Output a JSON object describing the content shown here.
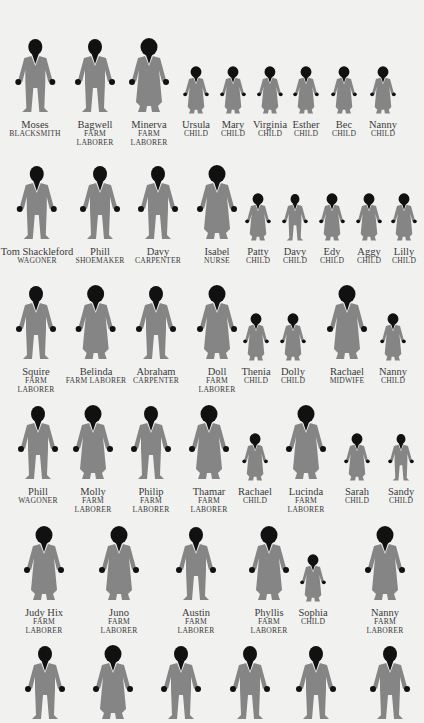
{
  "colors": {
    "background": "#f1f1f0",
    "body": "#858585",
    "head": "#111111",
    "text": "#3a3a3a"
  },
  "rows": [
    {
      "y": 36,
      "people": [
        {
          "name": "Moses",
          "occupation": "BLACKSMITH",
          "x": 35,
          "type": "man",
          "size": "adult"
        },
        {
          "name": "Bagwell",
          "occupation": "FARM LABORER",
          "x": 95,
          "type": "man",
          "size": "adult",
          "wrap": true
        },
        {
          "name": "Minerva",
          "occupation": "FARM LABORER",
          "x": 149,
          "type": "woman",
          "size": "adult",
          "wrap": true
        },
        {
          "name": "Ursula",
          "occupation": "CHILD",
          "x": 196,
          "type": "woman",
          "size": "child"
        },
        {
          "name": "Mary",
          "occupation": "CHILD",
          "x": 233,
          "type": "woman",
          "size": "child"
        },
        {
          "name": "Virginia",
          "occupation": "CHILD",
          "x": 270,
          "type": "woman",
          "size": "child"
        },
        {
          "name": "Esther",
          "occupation": "CHILD",
          "x": 306,
          "type": "woman",
          "size": "child"
        },
        {
          "name": "Bec",
          "occupation": "CHILD",
          "x": 344,
          "type": "woman",
          "size": "child"
        },
        {
          "name": "Nanny",
          "occupation": "CHILD",
          "x": 383,
          "type": "woman",
          "size": "child"
        }
      ]
    },
    {
      "y": 163,
      "people": [
        {
          "name": "Tom Shackleford",
          "occupation": "WAGONER",
          "x": 37,
          "type": "man",
          "size": "adult"
        },
        {
          "name": "Phill",
          "occupation": "SHOEMAKER",
          "x": 100,
          "type": "man",
          "size": "adult"
        },
        {
          "name": "Davy",
          "occupation": "CARPENTER",
          "x": 158,
          "type": "man",
          "size": "adult"
        },
        {
          "name": "Isabel",
          "occupation": "NURSE",
          "x": 217,
          "type": "woman",
          "size": "adult"
        },
        {
          "name": "Patty",
          "occupation": "CHILD",
          "x": 258,
          "type": "woman",
          "size": "child"
        },
        {
          "name": "Davy",
          "occupation": "CHILD",
          "x": 295,
          "type": "man",
          "size": "child"
        },
        {
          "name": "Edy",
          "occupation": "CHILD",
          "x": 332,
          "type": "woman",
          "size": "child"
        },
        {
          "name": "Aggy",
          "occupation": "CHILD",
          "x": 369,
          "type": "woman",
          "size": "child"
        },
        {
          "name": "Lilly",
          "occupation": "CHILD",
          "x": 404,
          "type": "woman",
          "size": "child"
        }
      ]
    },
    {
      "y": 283,
      "people": [
        {
          "name": "Squire",
          "occupation": "FARM LABORER",
          "x": 36,
          "type": "man",
          "size": "adult",
          "wrap": true
        },
        {
          "name": "Belinda",
          "occupation": "FARM LABORER",
          "x": 96,
          "type": "woman",
          "size": "adult"
        },
        {
          "name": "Abraham",
          "occupation": "CARPENTER",
          "x": 156,
          "type": "man",
          "size": "adult"
        },
        {
          "name": "Doll",
          "occupation": "FARM LABORER",
          "x": 217,
          "type": "woman",
          "size": "adult",
          "wrap": true
        },
        {
          "name": "Thenia",
          "occupation": "CHILD",
          "x": 256,
          "type": "woman",
          "size": "child"
        },
        {
          "name": "Dolly",
          "occupation": "CHILD",
          "x": 293,
          "type": "woman",
          "size": "child"
        },
        {
          "name": "Rachael",
          "occupation": "MIDWIFE",
          "x": 347,
          "type": "woman",
          "size": "adult"
        },
        {
          "name": "Nanny",
          "occupation": "CHILD",
          "x": 393,
          "type": "woman",
          "size": "child"
        }
      ]
    },
    {
      "y": 403,
      "people": [
        {
          "name": "Phill",
          "occupation": "WAGONER",
          "x": 38,
          "type": "man",
          "size": "adult"
        },
        {
          "name": "Molly",
          "occupation": "FARM LABORER",
          "x": 93,
          "type": "woman",
          "size": "adult",
          "wrap": true
        },
        {
          "name": "Philip",
          "occupation": "FARM LABORER",
          "x": 151,
          "type": "man",
          "size": "adult",
          "wrap": true
        },
        {
          "name": "Thamar",
          "occupation": "FARM LABORER",
          "x": 209,
          "type": "woman",
          "size": "adult",
          "wrap": true
        },
        {
          "name": "Rachael",
          "occupation": "CHILD",
          "x": 255,
          "type": "woman",
          "size": "child"
        },
        {
          "name": "Lucinda",
          "occupation": "FARM LABORER",
          "x": 306,
          "type": "woman",
          "size": "adult",
          "wrap": true
        },
        {
          "name": "Sarah",
          "occupation": "CHILD",
          "x": 357,
          "type": "woman",
          "size": "child"
        },
        {
          "name": "Sandy",
          "occupation": "CHILD",
          "x": 401,
          "type": "man",
          "size": "child"
        }
      ]
    },
    {
      "y": 524,
      "people": [
        {
          "name": "Judy Hix",
          "occupation": "FARM LABORER",
          "x": 44,
          "type": "woman",
          "size": "adult",
          "wrap": true
        },
        {
          "name": "Juno",
          "occupation": "FARM LABORER",
          "x": 119,
          "type": "woman",
          "size": "adult",
          "wrap": true
        },
        {
          "name": "Austin",
          "occupation": "FARM LABORER",
          "x": 196,
          "type": "man",
          "size": "adult",
          "wrap": true
        },
        {
          "name": "Phyllis",
          "occupation": "FARM LABORER",
          "x": 269,
          "type": "woman",
          "size": "adult",
          "wrap": true
        },
        {
          "name": "Sophia",
          "occupation": "CHILD",
          "x": 313,
          "type": "woman",
          "size": "child"
        },
        {
          "name": "Nanny",
          "occupation": "FARM LABORER",
          "x": 385,
          "type": "woman",
          "size": "adult",
          "wrap": true
        }
      ]
    },
    {
      "y": 643,
      "people": [
        {
          "name": "",
          "occupation": "",
          "x": 45,
          "type": "man",
          "size": "adult"
        },
        {
          "name": "",
          "occupation": "",
          "x": 113,
          "type": "woman",
          "size": "adult"
        },
        {
          "name": "",
          "occupation": "",
          "x": 181,
          "type": "man",
          "size": "adult"
        },
        {
          "name": "",
          "occupation": "",
          "x": 250,
          "type": "man",
          "size": "adult"
        },
        {
          "name": "",
          "occupation": "",
          "x": 316,
          "type": "man",
          "size": "adult"
        },
        {
          "name": "",
          "occupation": "",
          "x": 390,
          "type": "man",
          "size": "adult"
        }
      ]
    }
  ]
}
